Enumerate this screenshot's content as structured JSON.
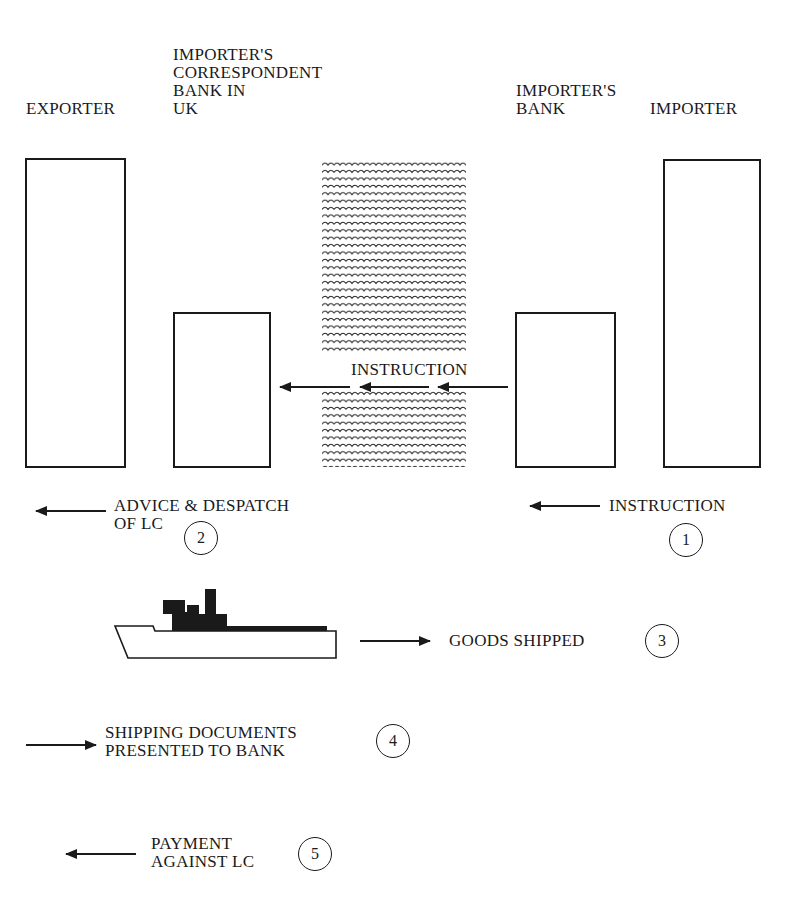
{
  "diagram": {
    "type": "letter-of-credit-flow",
    "parties": [
      {
        "id": "exporter",
        "label": "EXPORTER"
      },
      {
        "id": "correspondent",
        "label": "IMPORTER'S\nCORRESPONDENT\nBANK IN\nUK"
      },
      {
        "id": "importers_bank",
        "label": "IMPORTER'S\nBANK"
      },
      {
        "id": "importer",
        "label": "IMPORTER"
      }
    ],
    "sea_instruction": "INSTRUCTION",
    "steps": [
      {
        "num": "1",
        "label": "INSTRUCTION",
        "direction": "left"
      },
      {
        "num": "2",
        "label": "ADVICE & DESPATCH\nOF LC",
        "direction": "left"
      },
      {
        "num": "3",
        "label": "GOODS SHIPPED",
        "direction": "right"
      },
      {
        "num": "4",
        "label": "SHIPPING DOCUMENTS\nPRESENTED TO BANK",
        "direction": "right"
      },
      {
        "num": "5",
        "label": "PAYMENT\nAGAINST LC",
        "direction": "left"
      }
    ],
    "icons": {
      "sea": "waves-icon",
      "ship": "ship-icon"
    },
    "colors": {
      "ink": "#1a1a1a",
      "background": "#ffffff"
    }
  }
}
